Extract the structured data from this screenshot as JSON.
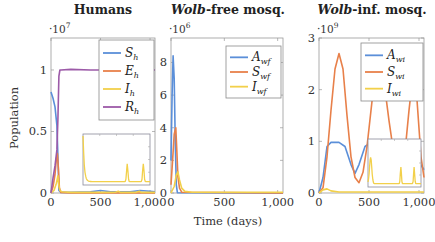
{
  "chart_data": [
    {
      "type": "line",
      "title": "Humans",
      "title_italic_part": "",
      "scale_label": "·10^7",
      "scale_base": "·10",
      "scale_exp": "7",
      "xlabel": "Time (days)",
      "ylabel": "Population",
      "xlim": [
        0,
        1050
      ],
      "ylim": [
        0,
        1.26
      ],
      "xticks": [
        0,
        500,
        1000
      ],
      "xtick_labels": [
        "0",
        "500",
        "1,000"
      ],
      "yticks": [
        0,
        0.5,
        1
      ],
      "ytick_labels": [
        "0",
        "0.5",
        "1"
      ],
      "legend_position": "upper right",
      "series": [
        {
          "name": "S_h",
          "label_main": "S",
          "label_sub": "h",
          "color": "#5b8fd9",
          "x": [
            0,
            20,
            40,
            60,
            70,
            80,
            100,
            200,
            400,
            500,
            600,
            800,
            900,
            1000,
            1050
          ],
          "y": [
            0.82,
            0.77,
            0.7,
            0.55,
            0.3,
            0.02,
            0.005,
            0.005,
            0.01,
            0.02,
            0.01,
            0.01,
            0.02,
            0.015,
            0.01
          ]
        },
        {
          "name": "E_h",
          "label_main": "E",
          "label_sub": "h",
          "color": "#e8804a",
          "x": [
            0,
            20,
            40,
            55,
            65,
            75,
            85,
            100,
            200,
            1050
          ],
          "y": [
            0.0,
            0.05,
            0.15,
            0.28,
            0.32,
            0.2,
            0.04,
            0.005,
            0.0,
            0.0
          ]
        },
        {
          "name": "I_h",
          "label_main": "I",
          "label_sub": "h",
          "color": "#f2d04a",
          "x": [
            0,
            30,
            55,
            70,
            80,
            90,
            110,
            200,
            600,
            650,
            680,
            700,
            850,
            890,
            910,
            1050
          ],
          "y": [
            0.0,
            0.02,
            0.08,
            0.14,
            0.06,
            0.02,
            0.01,
            0.005,
            0.005,
            0.006,
            0.015,
            0.005,
            0.005,
            0.015,
            0.005,
            0.005
          ]
        },
        {
          "name": "R_h",
          "label_main": "R",
          "label_sub": "h",
          "color": "#9c5aa8",
          "x": [
            0,
            20,
            40,
            60,
            70,
            80,
            90,
            100,
            200,
            400,
            600,
            800,
            1050
          ],
          "y": [
            0.0,
            0.12,
            0.22,
            0.35,
            0.6,
            0.95,
            1.0,
            1.0,
            1.005,
            1.0,
            1.0,
            1.0,
            1.0
          ]
        }
      ],
      "inset": {
        "shows": "I_h zoomed",
        "peaks_at_days": [
          0,
          660,
          900
        ]
      }
    },
    {
      "type": "line",
      "title": "-free mosq.",
      "title_italic_part": "Wolb",
      "scale_label": "·10^6",
      "scale_base": "·10",
      "scale_exp": "6",
      "xlabel": "Time (days)",
      "ylabel": "",
      "xlim": [
        0,
        1050
      ],
      "ylim": [
        0,
        9.5
      ],
      "xticks": [
        0,
        500,
        1000
      ],
      "xtick_labels": [
        "0",
        "500",
        "1,000"
      ],
      "yticks": [
        0,
        2,
        4,
        6,
        8
      ],
      "ytick_labels": [
        "0",
        "2",
        "4",
        "6",
        "8"
      ],
      "legend_position": "upper right",
      "series": [
        {
          "name": "A_wf",
          "label_main": "A",
          "label_sub": "wf",
          "color": "#5b8fd9",
          "x": [
            0,
            10,
            20,
            30,
            40,
            50,
            60,
            1050
          ],
          "y": [
            2.0,
            6.0,
            8.4,
            7.0,
            3.0,
            0.5,
            0.02,
            0.0
          ]
        },
        {
          "name": "S_wf",
          "label_main": "S",
          "label_sub": "wf",
          "color": "#e8804a",
          "x": [
            0,
            15,
            30,
            45,
            55,
            65,
            80,
            100,
            1050
          ],
          "y": [
            0.5,
            2.0,
            3.6,
            4.0,
            2.5,
            1.0,
            0.3,
            0.05,
            0.0
          ]
        },
        {
          "name": "I_wf",
          "label_main": "I",
          "label_sub": "wf",
          "color": "#f2d04a",
          "x": [
            0,
            30,
            50,
            65,
            80,
            100,
            130,
            200,
            1050
          ],
          "y": [
            0.0,
            0.4,
            1.1,
            1.3,
            0.8,
            0.3,
            0.1,
            0.05,
            0.05
          ]
        }
      ]
    },
    {
      "type": "line",
      "title": "-inf. mosq.",
      "title_italic_part": "Wolb",
      "scale_label": "·10^9",
      "scale_base": "·10",
      "scale_exp": "9",
      "xlabel": "Time (days)",
      "ylabel": "",
      "xlim": [
        0,
        1050
      ],
      "ylim": [
        0,
        3
      ],
      "xticks": [
        0,
        500,
        1000
      ],
      "xtick_labels": [
        "0",
        "500",
        "1,000"
      ],
      "yticks": [
        0,
        1,
        2,
        3
      ],
      "ytick_labels": [
        "0",
        "1",
        "2",
        "3"
      ],
      "legend_position": "upper right",
      "series": [
        {
          "name": "A_wi",
          "label_main": "A",
          "label_sub": "wi",
          "color": "#5b8fd9",
          "x": [
            0,
            40,
            80,
            120,
            200,
            260,
            320,
            360,
            400,
            460,
            520,
            600,
            700,
            800,
            900,
            960,
            1000,
            1050
          ],
          "y": [
            0.0,
            0.3,
            0.9,
            0.98,
            0.98,
            0.9,
            0.55,
            0.38,
            0.55,
            0.9,
            0.98,
            0.98,
            0.98,
            0.98,
            0.98,
            0.85,
            0.6,
            0.45
          ]
        },
        {
          "name": "S_wi",
          "label_main": "S",
          "label_sub": "wi",
          "color": "#e8804a",
          "x": [
            0,
            40,
            80,
            120,
            160,
            200,
            240,
            280,
            320,
            360,
            400,
            440,
            480,
            520,
            560,
            600,
            640,
            700,
            760,
            820,
            860,
            900,
            940,
            980,
            1020,
            1050
          ],
          "y": [
            0.0,
            0.1,
            0.7,
            1.6,
            2.4,
            2.7,
            2.4,
            1.5,
            0.7,
            0.3,
            0.2,
            0.4,
            0.9,
            1.6,
            2.3,
            2.6,
            2.3,
            1.4,
            0.6,
            0.4,
            0.8,
            1.6,
            2.3,
            1.8,
            0.7,
            0.3
          ]
        },
        {
          "name": "I_wi",
          "label_main": "I",
          "label_sub": "wi",
          "color": "#f2d04a",
          "x": [
            0,
            40,
            80,
            120,
            200,
            400,
            600,
            800,
            1050
          ],
          "y": [
            0.0,
            0.06,
            0.08,
            0.04,
            0.02,
            0.02,
            0.02,
            0.02,
            0.02
          ]
        }
      ],
      "inset": {
        "shows": "I_wi zoomed",
        "peaks_at_days": [
          50,
          620,
          870
        ]
      }
    }
  ],
  "figure": {
    "shared_xlabel": "Time (days)",
    "shared_ylabel": "Population"
  }
}
